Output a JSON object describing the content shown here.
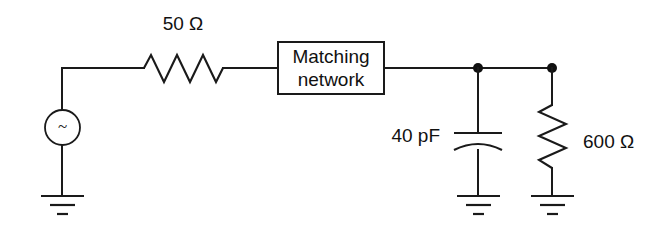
{
  "diagram": {
    "background_color": "#ffffff",
    "line_color": "#1a1a1a",
    "components": {
      "source": {
        "name": "AC voltage source",
        "symbol": "~",
        "type": "ac-source"
      },
      "series_resistor": {
        "label": "50 Ω",
        "value": "50",
        "unit": "Ω",
        "type": "resistor",
        "orientation": "horizontal"
      },
      "matching_network": {
        "line1": "Matching",
        "line2": "network",
        "type": "block"
      },
      "capacitor": {
        "label": "40 pF",
        "value": "40",
        "unit": "pF",
        "type": "capacitor",
        "orientation": "vertical"
      },
      "load_resistor": {
        "label": "600 Ω",
        "value": "600",
        "unit": "Ω",
        "type": "resistor",
        "orientation": "vertical"
      },
      "grounds": {
        "count": "3",
        "type": "earth-ground"
      }
    }
  }
}
